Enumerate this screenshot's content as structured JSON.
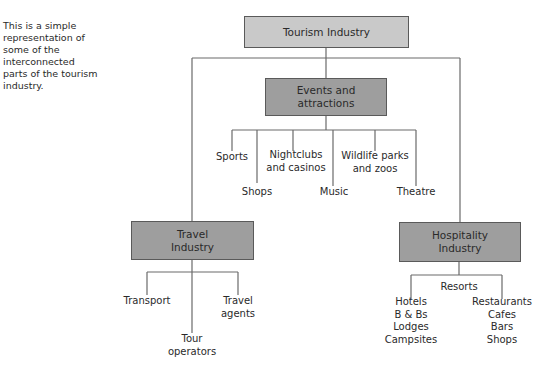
{
  "caption": "This is a simple representation of some of the interconnected parts of the tourism industry.",
  "colors": {
    "root_fill": "#c9c9c9",
    "category_fill": "#9e9e9e",
    "line": "#6a6a6a",
    "border": "#5a5a5a"
  },
  "root": {
    "label": "Tourism Industry"
  },
  "events": {
    "label_line1": "Events and",
    "label_line2": "attractions",
    "children": {
      "sports": "Sports",
      "shops": "Shops",
      "nightclubs_1": "Nightclubs",
      "nightclubs_2": "and casinos",
      "music": "Music",
      "wildlife_1": "Wildlife parks",
      "wildlife_2": "and zoos",
      "theatre": "Theatre"
    }
  },
  "travel": {
    "label_line1": "Travel",
    "label_line2": "Industry",
    "children": {
      "transport": "Transport",
      "tour_1": "Tour",
      "tour_2": "operators",
      "agents_1": "Travel",
      "agents_2": "agents"
    }
  },
  "hospitality": {
    "label_line1": "Hospitality",
    "label_line2": "Industry",
    "children": {
      "resorts": "Resorts",
      "accommodation": [
        "Hotels",
        "B & Bs",
        "Lodges",
        "Campsites"
      ],
      "food": [
        "Restaurants",
        "Cafes",
        "Bars",
        "Shops"
      ]
    }
  }
}
